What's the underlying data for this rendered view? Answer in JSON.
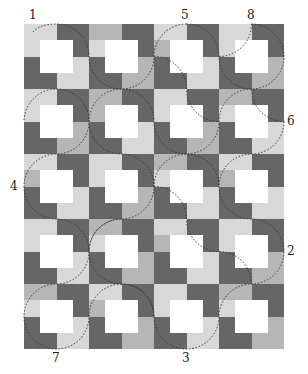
{
  "diagram": {
    "grid": {
      "cols": 4,
      "rows": 5,
      "block_size": 65,
      "origin": [
        24,
        24
      ]
    },
    "colors": {
      "white": "#ffffff",
      "light": "#d8d8d8",
      "medium": "#b6b6b6",
      "dark": "#666666",
      "curve": "#333333"
    },
    "block_pattern_cells": [
      [
        "A",
        "A",
        "D",
        "D"
      ],
      [
        "B",
        "W",
        "W",
        "D"
      ],
      [
        "C",
        "W",
        "W",
        "E"
      ],
      [
        "C",
        "C",
        "E",
        "E"
      ]
    ],
    "blocks": [
      {
        "A": "light",
        "B": "light",
        "C": "dark",
        "D": "dark",
        "E": "light"
      },
      {
        "A": "medium",
        "B": "light",
        "C": "dark",
        "D": "dark",
        "E": "medium"
      },
      {
        "A": "light",
        "B": "medium",
        "C": "dark",
        "D": "dark",
        "E": "light"
      },
      {
        "A": "light",
        "B": "light",
        "C": "dark",
        "D": "dark",
        "E": "medium"
      },
      {
        "A": "light",
        "B": "light",
        "C": "dark",
        "D": "dark",
        "E": "medium"
      },
      {
        "A": "medium",
        "B": "medium",
        "C": "dark",
        "D": "dark",
        "E": "light"
      },
      {
        "A": "light",
        "B": "light",
        "C": "dark",
        "D": "dark",
        "E": "medium"
      },
      {
        "A": "medium",
        "B": "light",
        "C": "dark",
        "D": "dark",
        "E": "light"
      },
      {
        "A": "light",
        "B": "medium",
        "C": "dark",
        "D": "dark",
        "E": "light"
      },
      {
        "A": "light",
        "B": "light",
        "C": "dark",
        "D": "dark",
        "E": "medium"
      },
      {
        "A": "medium",
        "B": "light",
        "C": "dark",
        "D": "dark",
        "E": "light"
      },
      {
        "A": "light",
        "B": "medium",
        "C": "dark",
        "D": "dark",
        "E": "light"
      },
      {
        "A": "light",
        "B": "light",
        "C": "dark",
        "D": "dark",
        "E": "light"
      },
      {
        "A": "medium",
        "B": "light",
        "C": "dark",
        "D": "dark",
        "E": "medium"
      },
      {
        "A": "light",
        "B": "medium",
        "C": "dark",
        "D": "dark",
        "E": "light"
      },
      {
        "A": "light",
        "B": "light",
        "C": "dark",
        "D": "dark",
        "E": "medium"
      },
      {
        "A": "medium",
        "B": "light",
        "C": "dark",
        "D": "dark",
        "E": "light"
      },
      {
        "A": "light",
        "B": "medium",
        "C": "dark",
        "D": "dark",
        "E": "medium"
      },
      {
        "A": "light",
        "B": "light",
        "C": "dark",
        "D": "dark",
        "E": "light"
      },
      {
        "A": "medium",
        "B": "light",
        "C": "dark",
        "D": "dark",
        "E": "medium"
      }
    ],
    "labels": [
      {
        "text": "1",
        "x": 29,
        "y": 9
      },
      {
        "text": "5",
        "x": 181,
        "y": 9
      },
      {
        "text": "8",
        "x": 247,
        "y": 9
      },
      {
        "text": "6",
        "x": 287,
        "y": 115
      },
      {
        "text": "4",
        "x": 10,
        "y": 180
      },
      {
        "text": "2",
        "x": 287,
        "y": 245
      },
      {
        "text": "7",
        "x": 52,
        "y": 352
      },
      {
        "text": "3",
        "x": 182,
        "y": 352
      }
    ]
  }
}
